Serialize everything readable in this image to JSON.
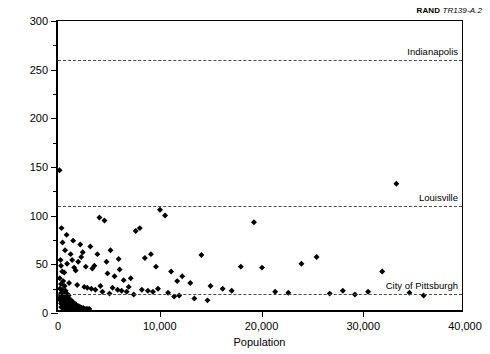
{
  "credit": {
    "mark": "RAND",
    "code": "TR139-A.2"
  },
  "axes": {
    "x": {
      "title": "Population",
      "min": 0,
      "max": 40000,
      "ticks": [
        0,
        10000,
        20000,
        30000,
        40000
      ],
      "tick_labels": [
        "0",
        "10,000",
        "20,000",
        "30,000",
        "40,000"
      ]
    },
    "y": {
      "title": "Per-capita expenditures ($)",
      "min": 0,
      "max": 300,
      "ticks": [
        0,
        50,
        100,
        150,
        200,
        250,
        300
      ],
      "tick_labels": [
        "0",
        "50",
        "100",
        "150",
        "200",
        "250",
        "300"
      ],
      "minor_ticks": [
        25,
        75,
        125,
        175,
        225,
        275
      ]
    }
  },
  "reference_lines": [
    {
      "label": "Indianapolis",
      "value": 260
    },
    {
      "label": "Louisville",
      "value": 110
    },
    {
      "label": "City of Pittsburgh",
      "value": 20
    }
  ],
  "chart_data": {
    "type": "scatter",
    "title": "",
    "xlabel": "Population",
    "ylabel": "Per-capita expenditures ($)",
    "xlim": [
      0,
      40000
    ],
    "ylim": [
      0,
      300
    ],
    "grid": false,
    "legend": "none",
    "marker": "diamond",
    "marker_color": "#000000",
    "annotations": [
      {
        "text": "Indianapolis",
        "y": 260,
        "type": "reference-line"
      },
      {
        "text": "Louisville",
        "y": 110,
        "type": "reference-line"
      },
      {
        "text": "City of Pittsburgh",
        "y": 20,
        "type": "reference-line"
      }
    ],
    "points": [
      [
        150,
        145
      ],
      [
        250,
        52
      ],
      [
        300,
        46
      ],
      [
        420,
        40
      ],
      [
        180,
        33
      ],
      [
        520,
        30
      ],
      [
        300,
        27
      ],
      [
        650,
        25
      ],
      [
        200,
        22
      ],
      [
        430,
        21
      ],
      [
        750,
        20
      ],
      [
        560,
        19
      ],
      [
        330,
        18
      ],
      [
        880,
        17
      ],
      [
        240,
        16
      ],
      [
        620,
        15
      ],
      [
        1050,
        15
      ],
      [
        410,
        14
      ],
      [
        790,
        13
      ],
      [
        160,
        13
      ],
      [
        930,
        12
      ],
      [
        530,
        12
      ],
      [
        1180,
        11
      ],
      [
        350,
        11
      ],
      [
        700,
        10
      ],
      [
        1320,
        10
      ],
      [
        220,
        10
      ],
      [
        860,
        9
      ],
      [
        450,
        9
      ],
      [
        1450,
        8
      ],
      [
        620,
        8
      ],
      [
        1000,
        8
      ],
      [
        290,
        7
      ],
      [
        1600,
        7
      ],
      [
        770,
        7
      ],
      [
        1150,
        6
      ],
      [
        380,
        6
      ],
      [
        1750,
        6
      ],
      [
        540,
        5
      ],
      [
        1290,
        5
      ],
      [
        900,
        5
      ],
      [
        1900,
        4
      ],
      [
        660,
        4
      ],
      [
        1430,
        4
      ],
      [
        2050,
        4
      ],
      [
        1050,
        3
      ],
      [
        320,
        3
      ],
      [
        1580,
        3
      ],
      [
        2200,
        3
      ],
      [
        780,
        3
      ],
      [
        1720,
        2
      ],
      [
        2350,
        2
      ],
      [
        1200,
        2
      ],
      [
        480,
        2
      ],
      [
        2500,
        2
      ],
      [
        1870,
        2
      ],
      [
        960,
        1
      ],
      [
        2650,
        1
      ],
      [
        1380,
        1
      ],
      [
        2800,
        1
      ],
      [
        2100,
        1
      ],
      [
        600,
        1
      ],
      [
        2950,
        1
      ],
      [
        1550,
        1
      ],
      [
        3100,
        1
      ],
      [
        2300,
        55
      ],
      [
        1400,
        52
      ],
      [
        900,
        48
      ],
      [
        2750,
        45
      ],
      [
        3400,
        43
      ],
      [
        1750,
        41
      ],
      [
        620,
        39
      ],
      [
        4100,
        96
      ],
      [
        4600,
        93
      ],
      [
        3200,
        66
      ],
      [
        5200,
        62
      ],
      [
        2450,
        60
      ],
      [
        3900,
        58
      ],
      [
        6100,
        42
      ],
      [
        4900,
        38
      ],
      [
        5600,
        35
      ],
      [
        7200,
        33
      ],
      [
        6500,
        31
      ],
      [
        8100,
        85
      ],
      [
        7700,
        82
      ],
      [
        9200,
        58
      ],
      [
        8600,
        54
      ],
      [
        10100,
        104
      ],
      [
        10600,
        98
      ],
      [
        9700,
        45
      ],
      [
        11200,
        40
      ],
      [
        12300,
        35
      ],
      [
        11800,
        30
      ],
      [
        13100,
        28
      ],
      [
        14200,
        57
      ],
      [
        15100,
        25
      ],
      [
        16300,
        22
      ],
      [
        17200,
        20
      ],
      [
        18100,
        45
      ],
      [
        19400,
        91
      ],
      [
        20200,
        44
      ],
      [
        21500,
        19
      ],
      [
        22800,
        18
      ],
      [
        24100,
        48
      ],
      [
        25600,
        55
      ],
      [
        26900,
        17
      ],
      [
        28200,
        20
      ],
      [
        29400,
        16
      ],
      [
        30700,
        19
      ],
      [
        32100,
        40
      ],
      [
        33500,
        131
      ],
      [
        34800,
        18
      ],
      [
        36200,
        15
      ],
      [
        2900,
        23
      ],
      [
        3700,
        21
      ],
      [
        4400,
        19
      ],
      [
        5100,
        17
      ],
      [
        5900,
        21
      ],
      [
        6800,
        19
      ],
      [
        7500,
        16
      ],
      [
        8900,
        20
      ],
      [
        9900,
        22
      ],
      [
        10900,
        18
      ],
      [
        12000,
        15
      ],
      [
        13500,
        12
      ],
      [
        1100,
        28
      ],
      [
        1900,
        26
      ],
      [
        2600,
        24
      ],
      [
        3300,
        22
      ],
      [
        4200,
        25
      ],
      [
        5400,
        23
      ],
      [
        6300,
        20
      ],
      [
        7000,
        24
      ],
      [
        8300,
        21
      ],
      [
        9400,
        19
      ],
      [
        11500,
        14
      ],
      [
        14800,
        10
      ],
      [
        700,
        62
      ],
      [
        1250,
        58
      ],
      [
        2000,
        50
      ],
      [
        450,
        70
      ],
      [
        1600,
        44
      ],
      [
        3600,
        46
      ],
      [
        4800,
        50
      ],
      [
        6000,
        53
      ],
      [
        350,
        85
      ],
      [
        850,
        78
      ],
      [
        1500,
        72
      ],
      [
        2200,
        68
      ]
    ]
  }
}
